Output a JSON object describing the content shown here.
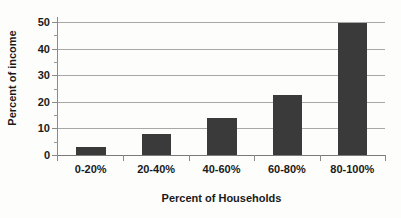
{
  "chart_data": {
    "type": "bar",
    "title": "",
    "subtitle": "",
    "categories": [
      "0-20%",
      "20-40%",
      "40-60%",
      "60-80%",
      "80-100%"
    ],
    "values": [
      3,
      8,
      14,
      22.5,
      49.5
    ],
    "xlabel": "Percent of Households",
    "ylabel": "Percent of income",
    "ylim": [
      0,
      50
    ],
    "yticks": [
      0,
      10,
      20,
      30,
      40,
      50
    ],
    "ytick_labels": [
      "0",
      "10",
      "20",
      "30",
      "40",
      "50"
    ],
    "yminor_ticks": [
      5,
      15,
      25,
      35,
      45
    ],
    "grid": "horizontal",
    "legend": "none",
    "series": [
      {
        "name": "Percent of income",
        "values": [
          3,
          8,
          14,
          22.5,
          49.5
        ]
      }
    ],
    "colors": {
      "bar_fill": "#3a3a3a",
      "gridline": "#a8a8a8",
      "axis": "#8a8a8a",
      "text": "#1a1a1a",
      "background": "#fdfdfc"
    }
  }
}
